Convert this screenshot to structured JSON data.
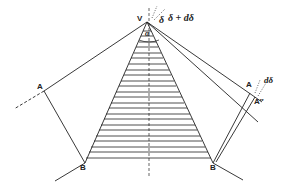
{
  "diagram": {
    "labels": {
      "vertex": "V",
      "left_A": "A",
      "left_B": "B",
      "right_A": "A",
      "right_A2": "A″",
      "right_B": "B",
      "alpha": "α",
      "delta": "δ",
      "delta_plus_d": "δ + dδ",
      "d_delta": "dδ"
    },
    "colors": {
      "line": "#222222",
      "background": "#ffffff"
    }
  }
}
